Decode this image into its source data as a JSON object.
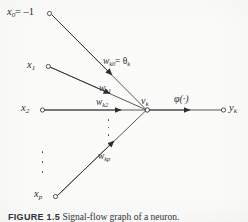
{
  "figure": {
    "title": "Signal-flow graph of a neuron",
    "caption_label": "FIGURE 1.5",
    "caption_text": "Signal-flow graph of a neuron.",
    "background_color": "#fbfbfa",
    "ink_color": "#2e2e2e"
  },
  "nodes": {
    "bias_input": "x",
    "bias_input_sub": "0",
    "bias_input_value": "= –1",
    "input_1": "x",
    "input_1_sub": "1",
    "input_2": "x",
    "input_2_sub": "2",
    "input_p": "x",
    "input_p_sub": "p",
    "induced_field": "v",
    "induced_field_sub": "k",
    "output": "y",
    "output_sub": "k"
  },
  "weights": {
    "w_k0": "w",
    "w_k0_sub": "k0",
    "w_k0_equals": "= θ",
    "w_k0_theta_sub": "k",
    "w_k1": "w",
    "w_k1_sub": "k1",
    "w_k2": "w",
    "w_k2_sub": "k2",
    "w_kp": "w",
    "w_kp_sub": "kp"
  },
  "activation": {
    "symbol": "φ(·)"
  },
  "ellipsis": {
    "inputs_vertical": "vertical-dots",
    "weights_vertical": "vertical-dots"
  }
}
